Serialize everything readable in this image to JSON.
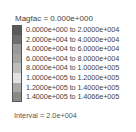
{
  "legend": {
    "title": "Magfac =  0.000e+000",
    "entries": [
      {
        "label": "0.0000e+000 to  2.0000e+004",
        "color": "#5a5a5a"
      },
      {
        "label": "2.0000e+004 to  4.0000e+004",
        "color": "#6e6e6e"
      },
      {
        "label": "4.0000e+004 to  6.0000e+004",
        "color": "#9a9a9a"
      },
      {
        "label": "6.0000e+004 to  8.0000e+004",
        "color": "#a4a4a4"
      },
      {
        "label": "8.0000e+004 to  1.0000e+005",
        "color": "#bdbdbd"
      },
      {
        "label": "1.0000e+005 to  1.2000e+005",
        "color": "#e2e2e2"
      },
      {
        "label": "1.2000e+005 to  1.4000e+005",
        "color": "#a9a9a9"
      },
      {
        "label": "1.4000e+005 to  1.4066e+005",
        "color": "#8a8a8a"
      }
    ],
    "interval": "Interval =  2.0e+004"
  }
}
